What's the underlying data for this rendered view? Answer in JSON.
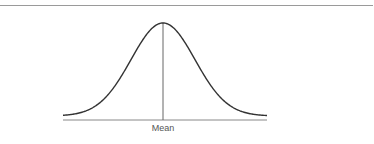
{
  "figure": {
    "type": "normal-distribution-curve",
    "axis_label": "Mean",
    "colors": {
      "curve": "#333333",
      "baseline": "#888888",
      "mean_line": "#666666",
      "top_rule": "#9a9a9a"
    }
  }
}
